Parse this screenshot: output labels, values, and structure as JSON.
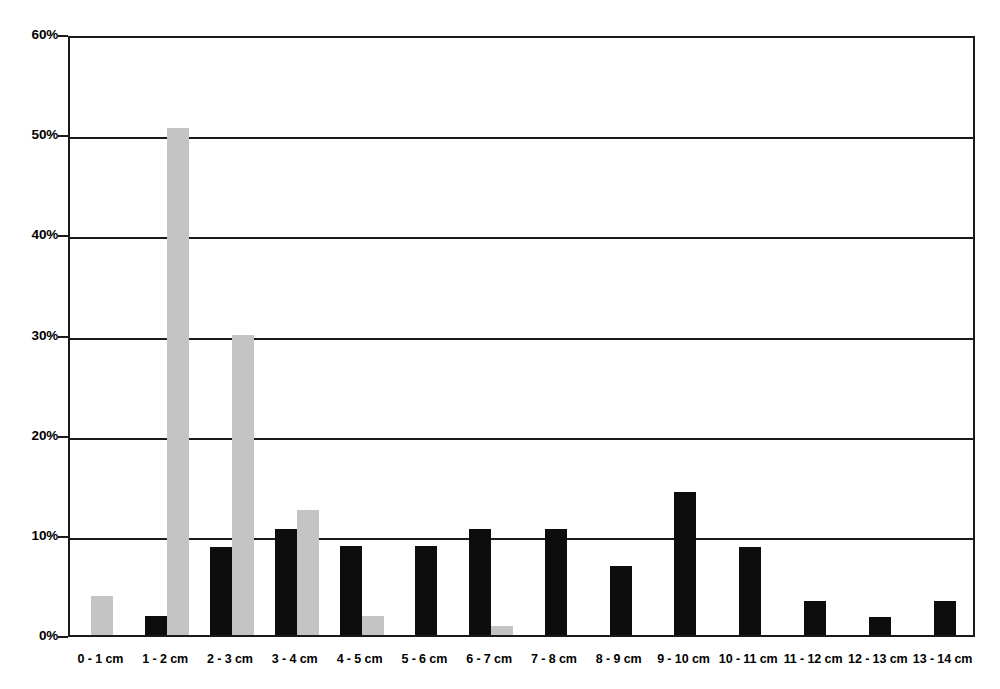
{
  "chart_data": {
    "type": "bar",
    "title": "",
    "subtitle": "",
    "xlabel": "",
    "ylabel": "",
    "ylim": [
      0,
      60
    ],
    "y_unit": "%",
    "grid": true,
    "legend": "none",
    "y_ticks": [
      "0%",
      "10%",
      "20%",
      "30%",
      "40%",
      "50%",
      "60%"
    ],
    "y_tick_values": [
      0,
      10,
      20,
      30,
      40,
      50,
      60
    ],
    "categories": [
      "0 - 1 cm",
      "1 - 2 cm",
      "2 - 3 cm",
      "3 - 4 cm",
      "4 - 5 cm",
      "5 - 6 cm",
      "6 - 7 cm",
      "7 - 8 cm",
      "8 - 9 cm",
      "9 - 10 cm",
      "10 - 11 cm",
      "11 - 12 cm",
      "12 - 13 cm",
      "13 - 14 cm"
    ],
    "series": [
      {
        "name": "series-black",
        "color": "#0d0d0d",
        "values": [
          0,
          1.9,
          8.8,
          10.6,
          8.9,
          8.9,
          10.6,
          10.6,
          6.9,
          14.3,
          8.8,
          3.4,
          1.8,
          3.4
        ]
      },
      {
        "name": "series-gray",
        "color": "#c4c4c4",
        "values": [
          3.9,
          50.6,
          30.0,
          12.5,
          1.9,
          0,
          0.9,
          0,
          0,
          0,
          0,
          0,
          0,
          0
        ]
      }
    ]
  }
}
